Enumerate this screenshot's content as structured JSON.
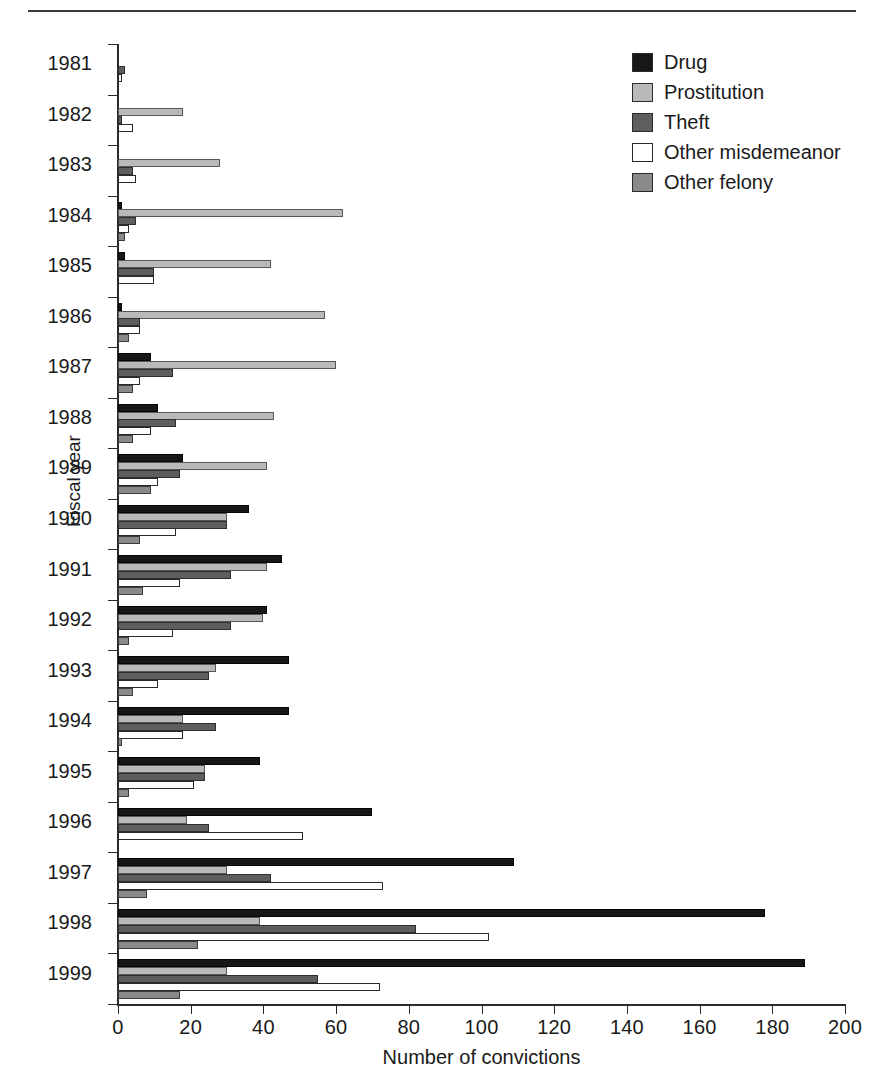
{
  "figure": {
    "title": "",
    "y_axis_title": "Fiscal year",
    "x_axis_title": "Number of convictions"
  },
  "legend": {
    "position": "top-right",
    "items": [
      {
        "label": "Drug",
        "key": "drug",
        "color": "#171717"
      },
      {
        "label": "Prostitution",
        "key": "prostitution",
        "color": "#b9b9b9"
      },
      {
        "label": "Theft",
        "key": "theft",
        "color": "#5e5e5e"
      },
      {
        "label": "Other misdemeanor",
        "key": "other_misdemeanor",
        "color": "#ffffff"
      },
      {
        "label": "Other felony",
        "key": "other_felony",
        "color": "#8a8a8a"
      }
    ]
  },
  "chart_data": {
    "type": "bar",
    "orientation": "horizontal",
    "grouped": true,
    "title": "",
    "xlabel": "Number of convictions",
    "ylabel": "Fiscal year",
    "xlim": [
      0,
      200
    ],
    "xticks": [
      0,
      20,
      40,
      60,
      80,
      100,
      120,
      140,
      160,
      180,
      200
    ],
    "grid": false,
    "legend_position": "top-right",
    "categories": [
      "1981",
      "1982",
      "1983",
      "1984",
      "1985",
      "1986",
      "1987",
      "1988",
      "1989",
      "1990",
      "1991",
      "1992",
      "1993",
      "1994",
      "1995",
      "1996",
      "1997",
      "1998",
      "1999"
    ],
    "series": [
      {
        "name": "Drug",
        "values": [
          0,
          0,
          0,
          1,
          2,
          1,
          9,
          11,
          18,
          36,
          45,
          41,
          47,
          47,
          39,
          70,
          109,
          178,
          189
        ]
      },
      {
        "name": "Prostitution",
        "values": [
          0,
          18,
          28,
          62,
          42,
          57,
          60,
          43,
          41,
          30,
          41,
          40,
          27,
          18,
          24,
          19,
          30,
          39,
          30
        ]
      },
      {
        "name": "Theft",
        "values": [
          2,
          1,
          4,
          5,
          10,
          6,
          15,
          16,
          17,
          30,
          31,
          31,
          25,
          27,
          24,
          25,
          42,
          82,
          55
        ]
      },
      {
        "name": "Other misdemeanor",
        "values": [
          1,
          4,
          5,
          3,
          10,
          6,
          6,
          9,
          11,
          16,
          17,
          15,
          11,
          18,
          21,
          51,
          73,
          102,
          72
        ]
      },
      {
        "name": "Other felony",
        "values": [
          0,
          0,
          0,
          2,
          0,
          3,
          4,
          4,
          9,
          6,
          7,
          3,
          4,
          1,
          3,
          0,
          8,
          22,
          17
        ]
      }
    ]
  }
}
